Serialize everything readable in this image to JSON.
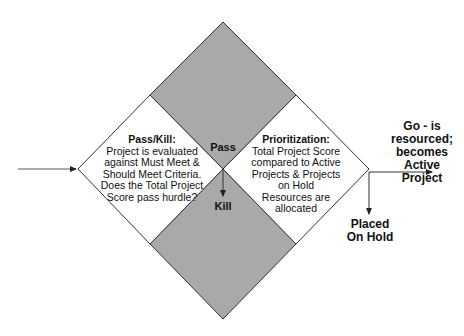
{
  "colors": {
    "background": "#ffffff",
    "shaded": "#a9a9a9",
    "line": "#333333"
  },
  "pass_kill": {
    "title": "Pass/Kill:",
    "lines": [
      "Project is evaluated",
      "against Must Meet &",
      "Should Meet Criteria.",
      "Does the Total Project",
      "Score pass hurdle?"
    ]
  },
  "prioritization": {
    "title": "Prioritization:",
    "lines": [
      "Total Project Score",
      "compared to Active",
      "Projects & Projects",
      "on Hold",
      "Resources are",
      "allocated"
    ]
  },
  "labels": {
    "pass": "Pass",
    "kill": "Kill",
    "go_lines": [
      "Go - is",
      "resourced;",
      "becomes Active",
      "Project"
    ],
    "hold_lines": [
      "Placed",
      "On Hold"
    ]
  }
}
